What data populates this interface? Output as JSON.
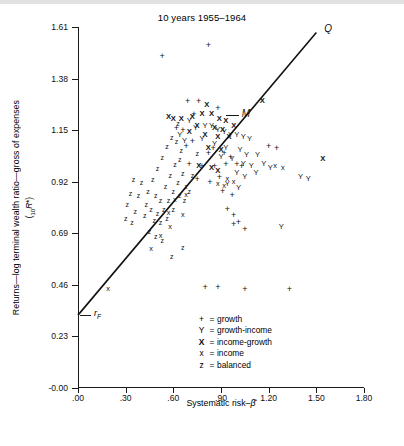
{
  "chart_data": {
    "type": "scatter",
    "title": "10 years 1955–1964",
    "xlabel": "Systematic risk–β̂",
    "ylabel": "Returns—log terminal wealth ratio—gross of expenses",
    "ylabel_sub": "(₁₀R*)",
    "xlim": [
      0.0,
      1.8
    ],
    "ylim": [
      0.0,
      1.61
    ],
    "xticks": [
      ".00",
      ".30",
      ".60",
      ".90",
      "1.20",
      "1.50",
      "1.80"
    ],
    "xtick_values": [
      0.0,
      0.3,
      0.6,
      0.9,
      1.2,
      1.5,
      1.8
    ],
    "yticks": [
      "-0.00",
      "0.23",
      "0.46",
      "0.69",
      "0.92",
      "1.15",
      "1.38",
      "1.61"
    ],
    "ytick_values": [
      0.0,
      0.23,
      0.46,
      0.69,
      0.92,
      1.15,
      1.38,
      1.61
    ],
    "grid": false,
    "legend_position": "bottom-center",
    "legend": [
      {
        "symbol": "+",
        "label": "growth",
        "bold": false
      },
      {
        "symbol": "Y",
        "label": "growth-income",
        "bold": false
      },
      {
        "symbol": "X",
        "label": "income-growth",
        "bold": true
      },
      {
        "symbol": "x",
        "label": "income",
        "bold": false
      },
      {
        "symbol": "z",
        "label": "balanced",
        "bold": false
      }
    ],
    "annotations": [
      {
        "name": "Q",
        "text": "Q",
        "x": 1.55,
        "y": 1.6
      },
      {
        "name": "M",
        "text": "M",
        "x": 1.03,
        "y": 1.22
      },
      {
        "name": "rf",
        "text": "r",
        "sub": "F",
        "x": 0.1,
        "y": 0.33
      }
    ],
    "market_line": {
      "name": "capital-market-line",
      "x0": 0.0,
      "y0": 0.325,
      "x1": 1.5,
      "y1": 1.585,
      "intercept": 0.325,
      "slope": 0.84
    },
    "series": [
      {
        "name": "growth",
        "symbol": "+",
        "points": [
          [
            0.53,
            1.48
          ],
          [
            0.82,
            1.53
          ],
          [
            0.69,
            1.28
          ],
          [
            0.76,
            1.28
          ],
          [
            0.73,
            1.22
          ],
          [
            0.62,
            1.16
          ],
          [
            0.66,
            1.15
          ],
          [
            0.88,
            1.25
          ],
          [
            0.68,
            1.08
          ],
          [
            0.85,
            1.07
          ],
          [
            0.82,
            1.05
          ],
          [
            0.92,
            1.05
          ],
          [
            0.96,
            1.03
          ],
          [
            0.7,
            1.0
          ],
          [
            0.78,
            0.99
          ],
          [
            0.86,
            0.99
          ],
          [
            0.93,
            1.0
          ],
          [
            1.0,
            1.0
          ],
          [
            1.03,
            0.99
          ],
          [
            0.89,
            0.94
          ],
          [
            0.75,
            0.93
          ],
          [
            0.83,
            0.92
          ],
          [
            0.91,
            0.88
          ],
          [
            0.97,
            0.86
          ],
          [
            0.94,
            0.8
          ],
          [
            0.98,
            0.77
          ],
          [
            1.01,
            0.74
          ],
          [
            1.05,
            0.71
          ],
          [
            1.2,
            1.08
          ],
          [
            1.25,
            1.07
          ],
          [
            1.33,
            0.44
          ],
          [
            1.05,
            0.44
          ],
          [
            0.8,
            0.45
          ],
          [
            0.88,
            0.45
          ],
          [
            0.98,
            0.73
          ],
          [
            0.72,
            1.1
          ]
        ]
      },
      {
        "name": "growth-income",
        "symbol": "Y",
        "points": [
          [
            0.7,
            1.19
          ],
          [
            0.74,
            1.16
          ],
          [
            0.8,
            1.17
          ],
          [
            0.84,
            1.17
          ],
          [
            0.88,
            1.15
          ],
          [
            0.92,
            1.14
          ],
          [
            0.96,
            1.13
          ],
          [
            1.0,
            1.13
          ],
          [
            1.04,
            1.12
          ],
          [
            1.08,
            1.11
          ],
          [
            0.78,
            1.11
          ],
          [
            0.86,
            1.09
          ],
          [
            0.93,
            1.07
          ],
          [
            1.02,
            1.06
          ],
          [
            1.06,
            1.04
          ],
          [
            0.9,
            1.03
          ],
          [
            0.97,
            1.02
          ],
          [
            1.04,
            1.0
          ],
          [
            1.0,
            0.96
          ],
          [
            1.05,
            0.94
          ],
          [
            0.94,
            0.91
          ],
          [
            1.01,
            0.89
          ],
          [
            1.09,
            0.99
          ],
          [
            1.12,
            0.96
          ],
          [
            1.17,
            1.0
          ],
          [
            1.4,
            0.94
          ],
          [
            1.45,
            0.93
          ],
          [
            1.28,
            0.72
          ],
          [
            0.64,
            1.13
          ],
          [
            0.67,
            1.1
          ],
          [
            1.13,
            1.04
          ],
          [
            1.21,
            0.98
          ]
        ]
      },
      {
        "name": "income-growth",
        "symbol": "X",
        "points": [
          [
            0.6,
            1.2
          ],
          [
            0.65,
            1.2
          ],
          [
            0.72,
            1.21
          ],
          [
            0.78,
            1.22
          ],
          [
            0.84,
            1.22
          ],
          [
            0.81,
            1.26
          ],
          [
            0.89,
            1.2
          ],
          [
            0.93,
            1.19
          ],
          [
            0.75,
            1.17
          ],
          [
            0.86,
            1.16
          ],
          [
            0.91,
            1.15
          ],
          [
            0.7,
            1.14
          ],
          [
            0.8,
            1.13
          ],
          [
            0.88,
            1.12
          ],
          [
            0.95,
            1.12
          ],
          [
            0.82,
            1.07
          ],
          [
            0.9,
            1.06
          ],
          [
            0.76,
            0.99
          ],
          [
            0.84,
            0.98
          ],
          [
            0.88,
            0.97
          ],
          [
            1.54,
            1.02
          ],
          [
            1.16,
            1.28
          ],
          [
            0.57,
            1.21
          ],
          [
            0.98,
            1.17
          ]
        ]
      },
      {
        "name": "income",
        "symbol": "x",
        "points": [
          [
            0.19,
            0.44
          ],
          [
            0.46,
            0.62
          ],
          [
            0.52,
            0.68
          ],
          [
            0.57,
            0.78
          ],
          [
            0.61,
            0.84
          ],
          [
            0.94,
            0.93
          ],
          [
            0.98,
            0.92
          ],
          [
            1.24,
            0.99
          ],
          [
            1.29,
            0.98
          ],
          [
            0.88,
            0.91
          ],
          [
            0.92,
            0.9
          ],
          [
            0.68,
            0.86
          ],
          [
            0.58,
            0.72
          ],
          [
            0.66,
            0.77
          ]
        ]
      },
      {
        "name": "balanced",
        "symbol": "z",
        "points": [
          [
            0.44,
            0.88
          ],
          [
            0.47,
            0.93
          ],
          [
            0.5,
            0.98
          ],
          [
            0.53,
            1.03
          ],
          [
            0.56,
            1.08
          ],
          [
            0.59,
            1.12
          ],
          [
            0.62,
            1.1
          ],
          [
            0.65,
            1.06
          ],
          [
            0.49,
            0.86
          ],
          [
            0.52,
            0.84
          ],
          [
            0.55,
            0.9
          ],
          [
            0.58,
            0.95
          ],
          [
            0.61,
            1.0
          ],
          [
            0.64,
            1.02
          ],
          [
            0.43,
            0.82
          ],
          [
            0.46,
            0.8
          ],
          [
            0.5,
            0.78
          ],
          [
            0.54,
            0.8
          ],
          [
            0.57,
            0.84
          ],
          [
            0.6,
            0.88
          ],
          [
            0.63,
            0.92
          ],
          [
            0.66,
            0.96
          ],
          [
            0.4,
            0.92
          ],
          [
            0.38,
            0.86
          ],
          [
            0.42,
            0.77
          ],
          [
            0.48,
            0.75
          ],
          [
            0.52,
            0.74
          ],
          [
            0.56,
            0.76
          ],
          [
            0.6,
            0.8
          ],
          [
            0.64,
            0.86
          ],
          [
            0.68,
            0.9
          ],
          [
            0.35,
            0.93
          ],
          [
            0.33,
            0.87
          ],
          [
            0.31,
            0.82
          ],
          [
            0.36,
            0.79
          ],
          [
            0.67,
            0.84
          ],
          [
            0.7,
            0.88
          ],
          [
            0.45,
            0.7
          ],
          [
            0.49,
            0.68
          ],
          [
            0.53,
            0.66
          ],
          [
            0.3,
            0.76
          ],
          [
            0.34,
            0.74
          ],
          [
            0.72,
            0.95
          ],
          [
            0.63,
            1.18
          ],
          [
            0.66,
            0.63
          ],
          [
            0.75,
            1.05
          ],
          [
            0.59,
            0.59
          ]
        ]
      }
    ]
  }
}
